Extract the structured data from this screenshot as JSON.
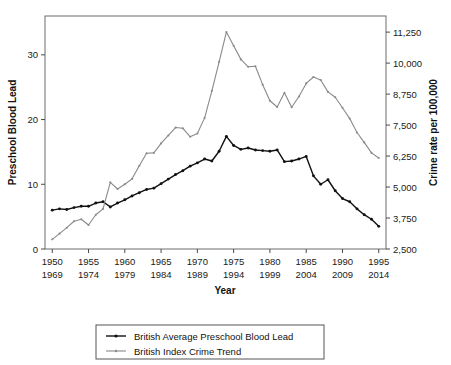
{
  "chart_data": {
    "type": "line",
    "title": "",
    "xlabel": "Year",
    "ylabel_left": "Preschool Blood Lead",
    "ylabel_right": "Crime rate per 100,000",
    "grid": false,
    "legend_position": "bottom",
    "x": [
      1950,
      1951,
      1952,
      1953,
      1954,
      1955,
      1956,
      1957,
      1958,
      1959,
      1960,
      1961,
      1962,
      1963,
      1964,
      1965,
      1966,
      1967,
      1968,
      1969,
      1970,
      1971,
      1972,
      1973,
      1974,
      1975,
      1976,
      1977,
      1978,
      1979,
      1980,
      1981,
      1982,
      1983,
      1984,
      1985,
      1986,
      1987,
      1988,
      1989,
      1990,
      1991,
      1992,
      1993,
      1994,
      1995
    ],
    "x_secondary": [
      1969,
      1970,
      1971,
      1972,
      1973,
      1974,
      1975,
      1976,
      1977,
      1978,
      1979,
      1980,
      1981,
      1982,
      1983,
      1984,
      1985,
      1986,
      1987,
      1988,
      1989,
      1990,
      1991,
      1992,
      1993,
      1994,
      1995,
      1996,
      1997,
      1998,
      1999,
      2000,
      2001,
      2002,
      2003,
      2004,
      2005,
      2006,
      2007,
      2008,
      2009,
      2010,
      2011,
      2012,
      2013,
      2014
    ],
    "xlim": [
      1949,
      1996
    ],
    "xticks": [
      1950,
      1955,
      1960,
      1965,
      1970,
      1975,
      1980,
      1985,
      1990,
      1995
    ],
    "xticklabels_top": [
      "1950",
      "1955",
      "1960",
      "1965",
      "1970",
      "1975",
      "1980",
      "1985",
      "1990",
      "1995"
    ],
    "xticklabels_bottom": [
      "1969",
      "1974",
      "1979",
      "1984",
      "1989",
      "1994",
      "1999",
      "2004",
      "2009",
      "2014"
    ],
    "ylim_left": [
      0,
      36
    ],
    "yticks_left": [
      0,
      10,
      20,
      30
    ],
    "yticklabels_left": [
      "0",
      "10",
      "20",
      "30"
    ],
    "ylim_right": [
      2500,
      11900
    ],
    "yticks_right": [
      2500,
      3750,
      5000,
      6250,
      7500,
      8750,
      10000,
      11250
    ],
    "yticklabels_right": [
      "2,500",
      "3,750",
      "5,000",
      "6,250",
      "7,500",
      "8,750",
      "10,000",
      "11,250"
    ],
    "series": [
      {
        "name": "British Average Preschool Blood Lead",
        "key": "lead",
        "axis": "left",
        "color": "#111111",
        "marker": "filled-circle",
        "values": [
          6.0,
          6.2,
          6.1,
          6.4,
          6.6,
          6.6,
          7.1,
          7.3,
          6.5,
          7.1,
          7.6,
          8.2,
          8.7,
          9.2,
          9.4,
          10.1,
          10.8,
          11.5,
          12.1,
          12.8,
          13.3,
          13.9,
          13.6,
          15.1,
          17.4,
          16.0,
          15.4,
          15.6,
          15.3,
          15.2,
          15.1,
          15.3,
          13.5,
          13.6,
          13.9,
          14.3,
          11.3,
          10.0,
          10.7,
          9.0,
          7.8,
          7.3,
          6.2,
          5.3,
          4.6,
          3.5
        ]
      },
      {
        "name": "British Index Crime Trend",
        "key": "crime",
        "axis": "right",
        "color": "#8a8a8a",
        "marker": "filled-circle",
        "values": [
          2890,
          3120,
          3360,
          3620,
          3700,
          3470,
          3880,
          4120,
          5190,
          4920,
          5110,
          5330,
          5860,
          6360,
          6380,
          6760,
          7080,
          7400,
          7370,
          7030,
          7160,
          7790,
          8880,
          10050,
          11250,
          10700,
          10150,
          9850,
          9870,
          9130,
          8480,
          8230,
          8800,
          8220,
          8650,
          9180,
          9440,
          9320,
          8840,
          8620,
          8200,
          7760,
          7200,
          6800,
          6380,
          6170
        ]
      }
    ],
    "legend": [
      {
        "label": "British Average Preschool Blood Lead",
        "color": "#111111"
      },
      {
        "label": "British Index Crime Trend",
        "color": "#8a8a8a"
      }
    ]
  },
  "colors": {
    "lead": "#111111",
    "crime": "#8a8a8a",
    "axis": "#4a4a4a",
    "background": "#ffffff"
  }
}
